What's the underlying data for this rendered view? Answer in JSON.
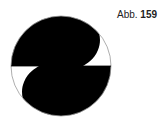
{
  "caption": {
    "prefix": "Abb.",
    "number": "159"
  },
  "figure": {
    "fill_color": "#000000",
    "outline_color": "#999999",
    "background": "#ffffff"
  }
}
